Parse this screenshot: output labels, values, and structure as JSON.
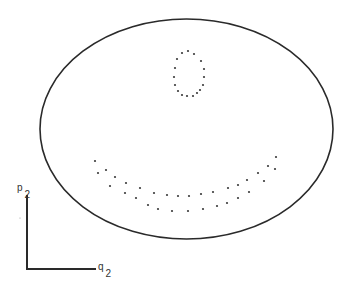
{
  "figure": {
    "kind": "phase-space-section",
    "background": "#ffffff",
    "stroke_color": "#2a2a2a",
    "dot_color": "#3a3a3a"
  },
  "boundary": {
    "shape": "ellipse",
    "cx": 186.5,
    "cy": 129,
    "rx": 146.5,
    "ry": 110,
    "stroke_width": 1.6
  },
  "axes": {
    "origin": [
      27,
      269
    ],
    "vertical_top": [
      27,
      195
    ],
    "horizontal_end": [
      96,
      269
    ],
    "stroke_width": 2,
    "y_label": {
      "base": "p",
      "sub": "2"
    },
    "x_label": {
      "base": "q",
      "sub": "2"
    }
  },
  "orbits": {
    "island_loop": {
      "points": [
        [
          188,
          51
        ],
        [
          182,
          53
        ],
        [
          194,
          54
        ],
        [
          177,
          59
        ],
        [
          201,
          61
        ],
        [
          175,
          68
        ],
        [
          204,
          69
        ],
        [
          174,
          77
        ],
        [
          204,
          77
        ],
        [
          175,
          85
        ],
        [
          203,
          85
        ],
        [
          178,
          91
        ],
        [
          200,
          90
        ],
        [
          182,
          95
        ],
        [
          187,
          96
        ],
        [
          193,
          96
        ],
        [
          197,
          93
        ]
      ]
    },
    "crescent_band": {
      "points": [
        [
          95,
          161
        ],
        [
          98,
          173
        ],
        [
          106,
          170
        ],
        [
          115,
          177
        ],
        [
          110,
          186
        ],
        [
          126,
          183
        ],
        [
          125,
          193
        ],
        [
          140,
          188
        ],
        [
          136,
          198
        ],
        [
          154,
          193
        ],
        [
          167,
          195
        ],
        [
          178,
          196
        ],
        [
          189,
          196
        ],
        [
          201,
          194
        ],
        [
          213,
          192
        ],
        [
          148,
          205
        ],
        [
          158,
          209
        ],
        [
          172,
          211
        ],
        [
          188,
          211
        ],
        [
          203,
          209
        ],
        [
          217,
          206
        ],
        [
          228,
          188
        ],
        [
          238,
          185
        ],
        [
          247,
          180
        ],
        [
          258,
          173
        ],
        [
          268,
          166
        ],
        [
          276,
          157
        ],
        [
          275,
          169
        ],
        [
          264,
          181
        ],
        [
          249,
          192
        ],
        [
          238,
          198
        ],
        [
          227,
          203
        ]
      ]
    },
    "dot_radius": 1.1
  },
  "stray_marks": [
    [
      20,
      218
    ]
  ]
}
